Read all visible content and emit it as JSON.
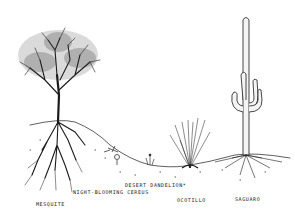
{
  "illustration": {
    "subject": "desert plants and root systems",
    "ink_color": "#1a1a1a",
    "background": "#ffffff",
    "plants": [
      {
        "id": "mesquite",
        "label": "MESQUITE"
      },
      {
        "id": "night-blooming-cereus",
        "label": "NIGHT-BLOOMING CEREUS"
      },
      {
        "id": "desert-dandelion",
        "label": "DESERT DANDELION*"
      },
      {
        "id": "ocotillo",
        "label": "OCOTILLO"
      },
      {
        "id": "saguaro",
        "label": "SAGUARO"
      }
    ]
  }
}
